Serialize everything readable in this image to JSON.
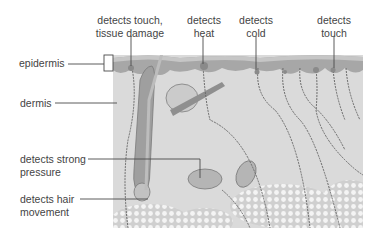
{
  "diagram": {
    "layers": [
      {
        "id": "epidermis",
        "label": "epidermis"
      },
      {
        "id": "dermis",
        "label": "dermis"
      }
    ],
    "receptors": [
      {
        "id": "touch-damage",
        "line1": "detects touch,",
        "line2": "tissue damage"
      },
      {
        "id": "heat",
        "line1": "detects",
        "line2": "heat"
      },
      {
        "id": "cold",
        "line1": "detects",
        "line2": "cold"
      },
      {
        "id": "touch",
        "line1": "detects",
        "line2": "touch"
      },
      {
        "id": "strong-pressure",
        "line1": "detects strong",
        "line2": "pressure"
      },
      {
        "id": "hair-movement",
        "line1": "detects hair",
        "line2": "movement"
      }
    ],
    "colors": {
      "dermis": "#d9d9d9",
      "epidermis": "#a9a9a9",
      "epidermis_top": "#c4c4c4",
      "nerve": "#6a6a6a",
      "fat": "#ededed",
      "leader": "#4a4a4a"
    }
  }
}
